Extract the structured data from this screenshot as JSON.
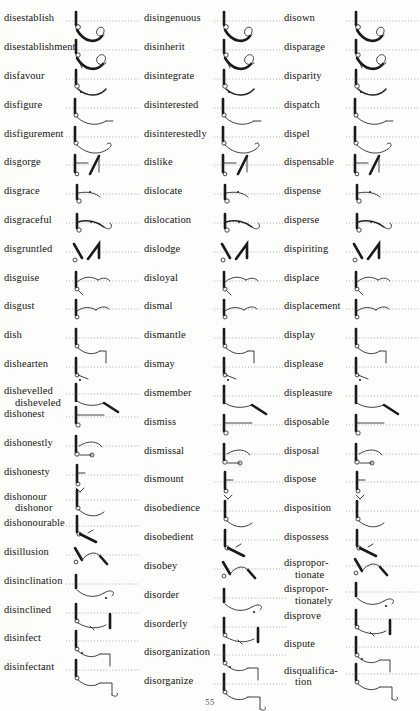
{
  "document": {
    "type": "shorthand-dictionary-page",
    "page_number": "55",
    "script": "Pitman shorthand",
    "ink_color": "#1a1a1a",
    "baseline_color": "#9a968e",
    "paper_color": "#fdfdfb"
  },
  "columns": [
    {
      "id": "column-1",
      "entries": [
        {
          "word": "disestablish",
          "alt": "",
          "y": 14,
          "outline": "a"
        },
        {
          "word": "disestablishment",
          "alt": "",
          "y": 47,
          "outline": "b"
        },
        {
          "word": "disfavour",
          "alt": "",
          "y": 80,
          "outline": "c"
        },
        {
          "word": "disfigure",
          "alt": "",
          "y": 113,
          "outline": "d"
        },
        {
          "word": "disfigurement",
          "alt": "",
          "y": 146,
          "outline": "e"
        },
        {
          "word": "disgorge",
          "alt": "",
          "y": 179,
          "outline": "f"
        },
        {
          "word": "disgrace",
          "alt": "",
          "y": 212,
          "outline": "g"
        },
        {
          "word": "disgraceful",
          "alt": "",
          "y": 245,
          "outline": "h"
        },
        {
          "word": "disgruntled",
          "alt": "",
          "y": 278,
          "outline": "i"
        },
        {
          "word": "disguise",
          "alt": "",
          "y": 311,
          "outline": "j"
        },
        {
          "word": "disgust",
          "alt": "",
          "y": 344,
          "outline": "k"
        },
        {
          "word": "dish",
          "alt": "",
          "y": 377,
          "outline": "l"
        },
        {
          "word": "dishearten",
          "alt": "",
          "y": 410,
          "outline": "m"
        },
        {
          "word": "dishevelled",
          "alt": "dishevelled-alt",
          "y": 441,
          "outline": "n"
        },
        {
          "word": "dishonest",
          "alt": "",
          "y": 467,
          "outline": "o"
        },
        {
          "word": "dishonestly",
          "alt": "",
          "y": 500,
          "outline": "p"
        },
        {
          "word": "dishonesty",
          "alt": "",
          "y": 533,
          "outline": "q"
        },
        {
          "word": "dishonour",
          "alt": "dishonour-alt",
          "y": 562,
          "outline": "r"
        },
        {
          "word": "dishonourable",
          "alt": "",
          "y": 592,
          "outline": "s"
        },
        {
          "word": "disillusion",
          "alt": "",
          "y": 625,
          "outline": "t"
        },
        {
          "word": "disinclination",
          "alt": "",
          "y": 658,
          "outline": "u"
        },
        {
          "word": "disinclined",
          "alt": "",
          "y": 691,
          "outline": "v"
        },
        {
          "word": "disinfect",
          "alt": "",
          "y": 724,
          "outline": "w"
        },
        {
          "word": "disinfectant",
          "alt": "",
          "y": 757,
          "outline": "x"
        }
      ]
    },
    {
      "id": "column-2",
      "entries": [
        {
          "word": "disingenuous",
          "alt": "",
          "y": 14,
          "outline": "a"
        },
        {
          "word": "disinherit",
          "alt": "",
          "y": 47,
          "outline": "b"
        },
        {
          "word": "disintegrate",
          "alt": "",
          "y": 80,
          "outline": "c"
        },
        {
          "word": "disinterested",
          "alt": "",
          "y": 113,
          "outline": "d"
        },
        {
          "word": "disinterestedly",
          "alt": "",
          "y": 146,
          "outline": "e"
        },
        {
          "word": "dislike",
          "alt": "",
          "y": 179,
          "outline": "f"
        },
        {
          "word": "dislocate",
          "alt": "",
          "y": 212,
          "outline": "g"
        },
        {
          "word": "dislocation",
          "alt": "",
          "y": 245,
          "outline": "h"
        },
        {
          "word": "dislodge",
          "alt": "",
          "y": 278,
          "outline": "i"
        },
        {
          "word": "disloyal",
          "alt": "",
          "y": 311,
          "outline": "j"
        },
        {
          "word": "dismal",
          "alt": "",
          "y": 344,
          "outline": "k"
        },
        {
          "word": "dismantle",
          "alt": "",
          "y": 377,
          "outline": "l"
        },
        {
          "word": "dismay",
          "alt": "",
          "y": 410,
          "outline": "m"
        },
        {
          "word": "dismember",
          "alt": "",
          "y": 443,
          "outline": "n"
        },
        {
          "word": "dismiss",
          "alt": "",
          "y": 476,
          "outline": "o"
        },
        {
          "word": "dismissal",
          "alt": "",
          "y": 509,
          "outline": "p"
        },
        {
          "word": "dismount",
          "alt": "",
          "y": 542,
          "outline": "q"
        },
        {
          "word": "disobedience",
          "alt": "",
          "y": 575,
          "outline": "r"
        },
        {
          "word": "disobedient",
          "alt": "",
          "y": 608,
          "outline": "s"
        },
        {
          "word": "disobey",
          "alt": "",
          "y": 641,
          "outline": "t"
        },
        {
          "word": "disorder",
          "alt": "",
          "y": 674,
          "outline": "u"
        },
        {
          "word": "disorderly",
          "alt": "",
          "y": 707,
          "outline": "v"
        },
        {
          "word": "disorganization",
          "alt": "",
          "y": 740,
          "outline": "w"
        },
        {
          "word": "disorganize",
          "alt": "",
          "y": 773,
          "outline": "x"
        }
      ]
    },
    {
      "id": "column-3",
      "entries": [
        {
          "word": "disown",
          "alt": "",
          "y": 14,
          "outline": "a"
        },
        {
          "word": "disparage",
          "alt": "",
          "y": 47,
          "outline": "b"
        },
        {
          "word": "disparity",
          "alt": "",
          "y": 80,
          "outline": "c"
        },
        {
          "word": "dispatch",
          "alt": "",
          "y": 113,
          "outline": "d"
        },
        {
          "word": "dispel",
          "alt": "",
          "y": 146,
          "outline": "e"
        },
        {
          "word": "dispensable",
          "alt": "",
          "y": 179,
          "outline": "f"
        },
        {
          "word": "dispense",
          "alt": "",
          "y": 212,
          "outline": "g"
        },
        {
          "word": "disperse",
          "alt": "",
          "y": 245,
          "outline": "h"
        },
        {
          "word": "dispiriting",
          "alt": "",
          "y": 278,
          "outline": "i"
        },
        {
          "word": "displace",
          "alt": "",
          "y": 311,
          "outline": "j"
        },
        {
          "word": "displacement",
          "alt": "",
          "y": 344,
          "outline": "k"
        },
        {
          "word": "display",
          "alt": "",
          "y": 377,
          "outline": "l"
        },
        {
          "word": "displease",
          "alt": "",
          "y": 410,
          "outline": "m"
        },
        {
          "word": "displeasure",
          "alt": "",
          "y": 443,
          "outline": "n"
        },
        {
          "word": "disposable",
          "alt": "",
          "y": 476,
          "outline": "o"
        },
        {
          "word": "disposal",
          "alt": "",
          "y": 509,
          "outline": "p"
        },
        {
          "word": "dispose",
          "alt": "",
          "y": 542,
          "outline": "q"
        },
        {
          "word": "disposition",
          "alt": "",
          "y": 575,
          "outline": "r"
        },
        {
          "word": "dispossess",
          "alt": "",
          "y": 608,
          "outline": "s"
        },
        {
          "word": "dispropor-",
          "alt": "disproportionate-alt",
          "y": 638,
          "outline": "t"
        },
        {
          "word": "dispropor-",
          "alt": "disproportionately-alt",
          "y": 668,
          "outline": "u"
        },
        {
          "word": "disprove",
          "alt": "",
          "y": 698,
          "outline": "v"
        },
        {
          "word": "dispute",
          "alt": "",
          "y": 731,
          "outline": "w"
        },
        {
          "word": "disqualifica-",
          "alt": "disqualification-alt",
          "y": 761,
          "outline": "x"
        }
      ]
    }
  ],
  "alt_spellings": {
    "dishevelled-alt": "disheveled",
    "dishonour-alt": "dishonor",
    "disproportionate-alt": "tionate",
    "disproportionately-alt": "tionately",
    "disqualification-alt": "tion"
  }
}
